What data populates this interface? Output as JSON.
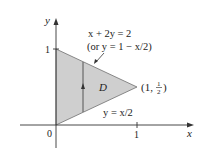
{
  "figure": {
    "axes": {
      "x_label": "x",
      "y_label": "y",
      "origin_label": "0",
      "x_tick_label": "1",
      "y_tick_label": "1"
    },
    "region": {
      "label": "D",
      "fill_color": "#cfcfcf",
      "vertices": [
        [
          0,
          0
        ],
        [
          0,
          1
        ],
        [
          1,
          0.5
        ]
      ]
    },
    "upper_boundary": {
      "equation": "x + 2y = 2",
      "alt_equation": "(or y = 1 − x/2)"
    },
    "lower_boundary": {
      "equation": "y = x/2"
    },
    "vertex_label": {
      "open": "(1, ",
      "num": "1",
      "den": "2",
      "close": ")"
    }
  }
}
